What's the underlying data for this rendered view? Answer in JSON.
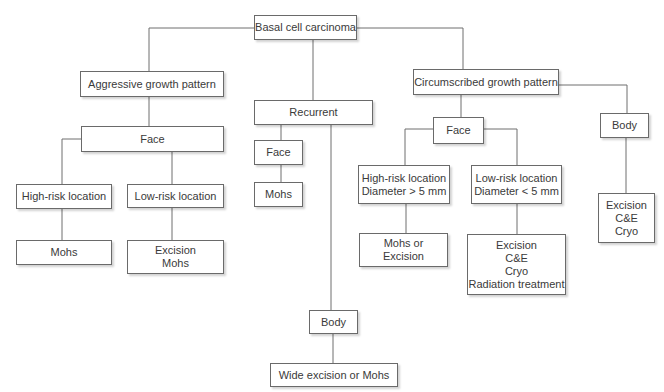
{
  "diagram": {
    "type": "decision-tree",
    "root": "Basal cell carcinoma",
    "nodes": {
      "root": [
        "Basal cell carcinoma"
      ],
      "aggressive": [
        "Aggressive growth pattern"
      ],
      "recurrent": [
        "Recurrent"
      ],
      "circumscribed": [
        "Circumscribed growth pattern"
      ],
      "agg_face": [
        "Face"
      ],
      "rec_face": [
        "Face"
      ],
      "rec_face_tx": [
        "Mohs"
      ],
      "circ_face": [
        "Face"
      ],
      "circ_body": [
        "Body"
      ],
      "agg_high": [
        "High-risk location"
      ],
      "agg_low": [
        "Low-risk location"
      ],
      "agg_high_tx": [
        "Mohs"
      ],
      "agg_low_tx": [
        "Excision",
        "Mohs"
      ],
      "circ_high": [
        "High-risk location",
        "Diameter > 5 mm"
      ],
      "circ_low": [
        "Low-risk location",
        "Diameter < 5 mm"
      ],
      "circ_body_tx": [
        "Excision",
        "C&E",
        "Cryo"
      ],
      "circ_high_tx": [
        "Mohs or",
        "Excision"
      ],
      "circ_low_tx": [
        "Excision",
        "C&E",
        "Cryo",
        "Radiation treatment"
      ],
      "rec_body": [
        "Body"
      ],
      "rec_body_tx": [
        "Wide excision or Mohs"
      ]
    },
    "edges": [
      [
        "root",
        "aggressive"
      ],
      [
        "root",
        "recurrent"
      ],
      [
        "root",
        "circumscribed"
      ],
      [
        "aggressive",
        "agg_face"
      ],
      [
        "agg_face",
        "agg_high"
      ],
      [
        "agg_face",
        "agg_low"
      ],
      [
        "agg_high",
        "agg_high_tx"
      ],
      [
        "agg_low",
        "agg_low_tx"
      ],
      [
        "recurrent",
        "rec_face"
      ],
      [
        "rec_face",
        "rec_face_tx"
      ],
      [
        "recurrent",
        "rec_body"
      ],
      [
        "rec_body",
        "rec_body_tx"
      ],
      [
        "circumscribed",
        "circ_face"
      ],
      [
        "circumscribed",
        "circ_body"
      ],
      [
        "circ_face",
        "circ_high"
      ],
      [
        "circ_face",
        "circ_low"
      ],
      [
        "circ_high",
        "circ_high_tx"
      ],
      [
        "circ_low",
        "circ_low_tx"
      ],
      [
        "circ_body",
        "circ_body_tx"
      ]
    ],
    "colors": {
      "line": "#6e6e6e",
      "border": "#6a6a6a",
      "text": "#3a3a3a",
      "background": "#ffffff"
    }
  }
}
